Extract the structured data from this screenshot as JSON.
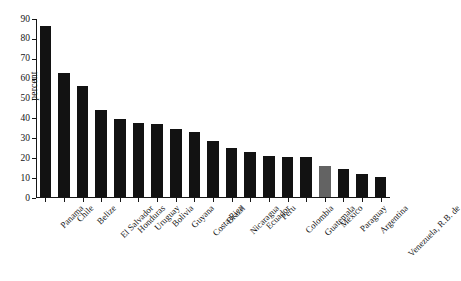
{
  "chart_data": {
    "type": "bar",
    "title": "",
    "subtitle": "",
    "xlabel": "",
    "ylabel": "percent",
    "ylim": [
      0,
      90
    ],
    "ytick_step": 10,
    "yticks": [
      0,
      10,
      20,
      30,
      40,
      50,
      60,
      70,
      80,
      90
    ],
    "grid": false,
    "legend": "none",
    "bar_color": "#121212",
    "highlight_color": "#636363",
    "highlight_category": "Mexico",
    "categories": [
      "Panama",
      "Chile",
      "Belize",
      "El Salvador",
      "Honduras",
      "Uruguay",
      "Bolivia",
      "Guyana",
      "Costa Rica",
      "Brazil",
      "Nicaragua",
      "Ecuador",
      "Peru",
      "Colombia",
      "Guatemala",
      "Mexico",
      "Paraguay",
      "Argentina",
      "Venezuela, R.B. de"
    ],
    "values": [
      86,
      62.5,
      56,
      43.5,
      39,
      37,
      36.5,
      34,
      32.5,
      28,
      24.5,
      22.5,
      20.5,
      20,
      20,
      15.5,
      14,
      11.5,
      10
    ]
  }
}
